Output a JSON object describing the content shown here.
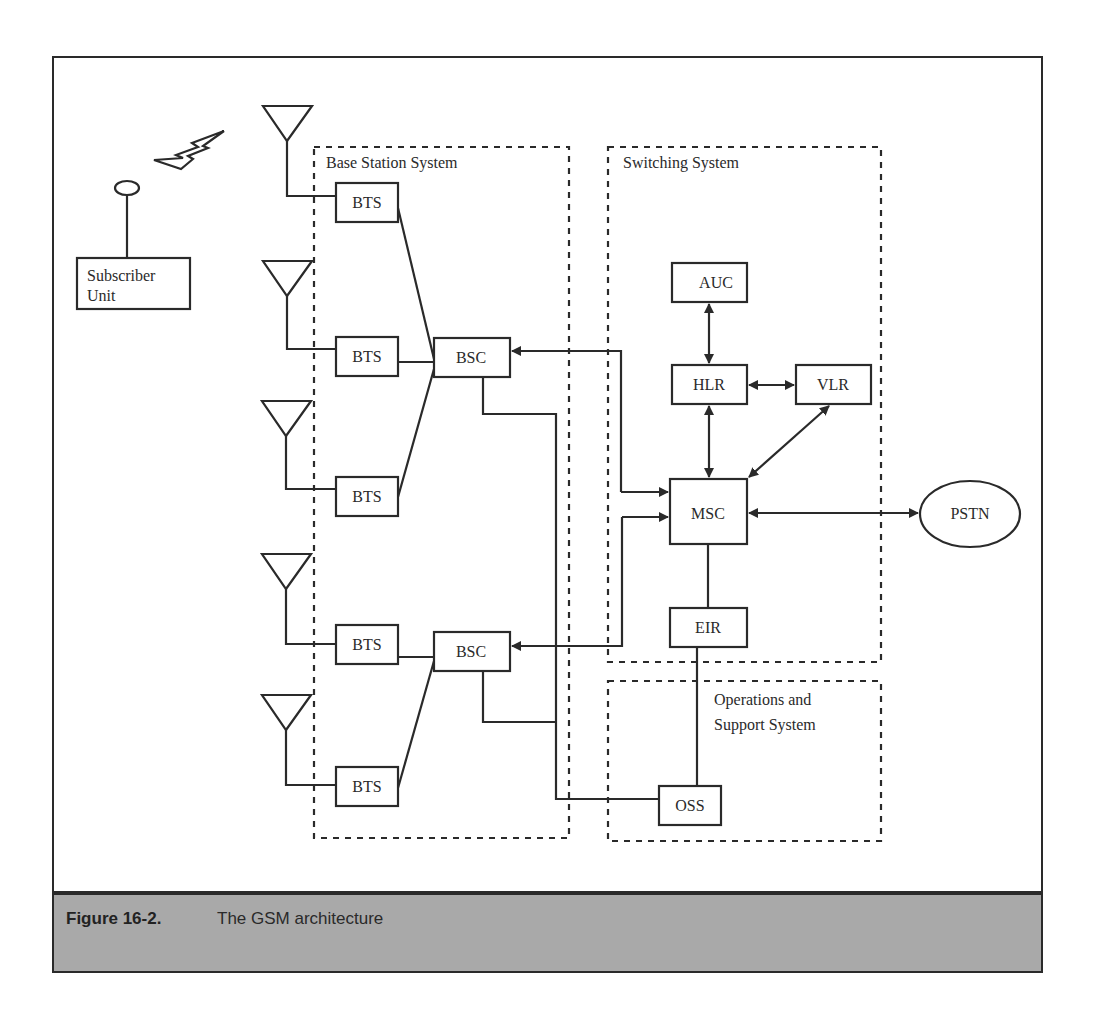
{
  "figure": {
    "number": "Figure 16-2.",
    "caption": "The GSM architecture"
  },
  "groups": {
    "base_station_system": "Base Station System",
    "switching_system": "Switching System",
    "oss_line1": "Operations and",
    "oss_line2": "Support  System"
  },
  "nodes": {
    "subscriber_line1": "Subscriber",
    "subscriber_line2": "Unit",
    "bts1": "BTS",
    "bts2": "BTS",
    "bts3": "BTS",
    "bts4": "BTS",
    "bts5": "BTS",
    "bsc1": "BSC",
    "bsc2": "BSC",
    "auc": "AUC",
    "hlr": "HLR",
    "vlr": "VLR",
    "msc": "MSC",
    "eir": "EIR",
    "oss": "OSS",
    "pstn": "PSTN"
  },
  "icons": {
    "antenna": "antenna-icon",
    "radio_link": "lightning-bolt-icon",
    "mobile_antenna": "mobile-antenna-icon"
  },
  "colors": {
    "line": "#2a2a2a",
    "caption_band": "#a9a9a9"
  }
}
